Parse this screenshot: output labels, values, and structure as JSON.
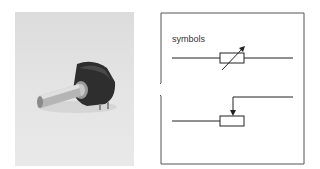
{
  "photo": {
    "subject": "potentiometer-component-photo",
    "alt": "Rotary potentiometer with metal shaft"
  },
  "callout": {
    "label": "symbols",
    "symbols": [
      {
        "name": "variable-resistor-symbol",
        "description": "Resistor rectangle with diagonal arrow"
      },
      {
        "name": "potentiometer-symbol",
        "description": "Resistor rectangle with wiper arrow from above"
      }
    ]
  },
  "colors": {
    "line": "#222222",
    "frame": "#555555",
    "background": "#ffffff",
    "photo_bg": "#e2e2e2"
  }
}
